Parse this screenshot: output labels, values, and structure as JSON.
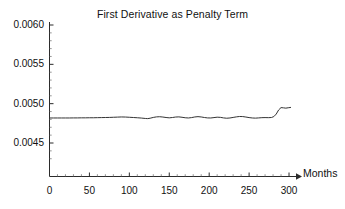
{
  "chart_data": {
    "type": "line",
    "title": "First Derivative as Penalty Term",
    "xlabel": "Months",
    "ylabel": "",
    "xlim": [
      0,
      310
    ],
    "ylim": [
      0.0042,
      0.006
    ],
    "grid": false,
    "legend": "none",
    "line_color": "#333333",
    "xticks": [
      0,
      50,
      100,
      150,
      200,
      250,
      300
    ],
    "xtick_labels": [
      "0",
      "50",
      "100",
      "150",
      "200",
      "250",
      "300"
    ],
    "yticks": [
      0.0045,
      0.005,
      0.0055,
      0.006
    ],
    "ytick_labels": [
      "0.0045",
      "0.0050",
      "0.0055",
      "0.0060"
    ],
    "series": [
      {
        "name": "first-derivative-penalty",
        "x": [
          0,
          5,
          10,
          15,
          20,
          25,
          30,
          35,
          40,
          45,
          50,
          55,
          60,
          65,
          70,
          75,
          80,
          85,
          90,
          95,
          100,
          105,
          110,
          115,
          120,
          123,
          126,
          130,
          134,
          138,
          142,
          146,
          150,
          154,
          158,
          162,
          166,
          170,
          174,
          178,
          182,
          186,
          190,
          194,
          198,
          202,
          206,
          210,
          214,
          218,
          222,
          226,
          230,
          234,
          238,
          242,
          246,
          250,
          254,
          258,
          262,
          266,
          270,
          274,
          278,
          281,
          284,
          287,
          290,
          293,
          296,
          299,
          302
        ],
        "y": [
          0.004818,
          0.004818,
          0.004818,
          0.004818,
          0.004818,
          0.004818,
          0.004819,
          0.004819,
          0.00482,
          0.00482,
          0.004821,
          0.004821,
          0.004822,
          0.004823,
          0.004824,
          0.004825,
          0.004827,
          0.004829,
          0.004831,
          0.00483,
          0.004827,
          0.004824,
          0.004821,
          0.004817,
          0.004812,
          0.00481,
          0.004815,
          0.004825,
          0.004832,
          0.004834,
          0.00483,
          0.004824,
          0.00482,
          0.004824,
          0.00483,
          0.004832,
          0.004827,
          0.004821,
          0.004818,
          0.004823,
          0.004831,
          0.004835,
          0.004831,
          0.004824,
          0.004819,
          0.004818,
          0.004823,
          0.004828,
          0.004826,
          0.004819,
          0.004815,
          0.004818,
          0.004825,
          0.004832,
          0.004837,
          0.004836,
          0.00483,
          0.004823,
          0.004818,
          0.004816,
          0.004819,
          0.004822,
          0.004823,
          0.004822,
          0.004824,
          0.004836,
          0.004868,
          0.00492,
          0.00495,
          0.004947,
          0.004943,
          0.004948,
          0.004952
        ]
      }
    ],
    "annotations": {
      "axis_arrow": "arrow at right end of x-axis pointing right"
    }
  },
  "axis": {
    "x_label_text": "Months"
  }
}
